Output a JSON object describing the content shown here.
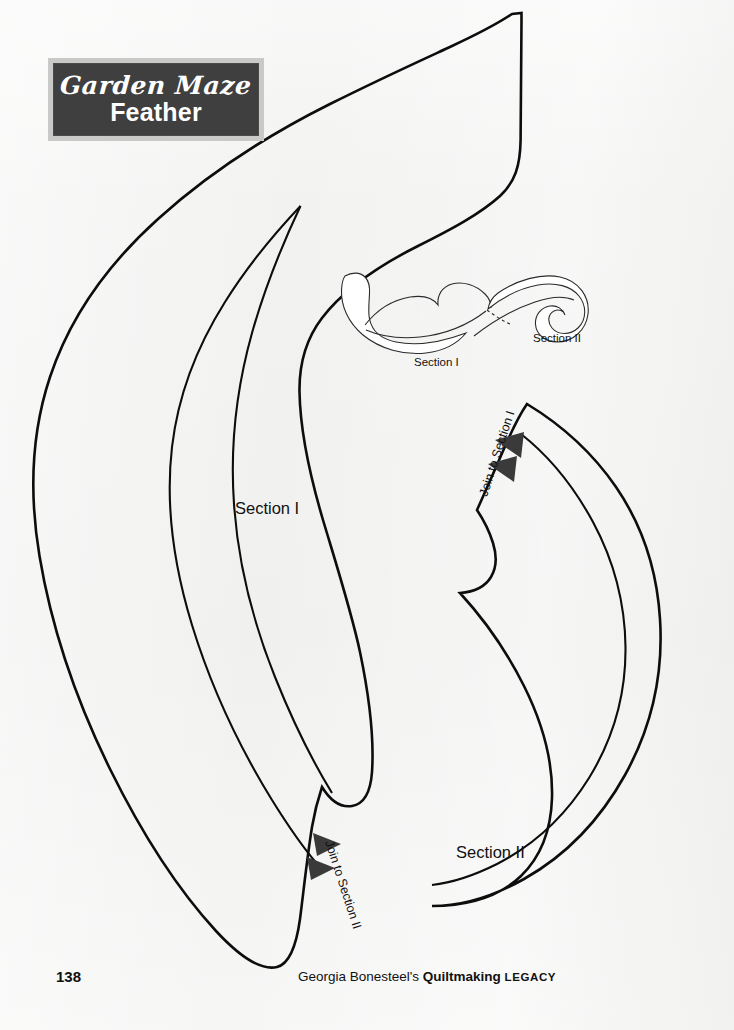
{
  "page": {
    "background_color": "#f2f2f1",
    "width": 734,
    "height": 1030
  },
  "title_block": {
    "script_line": "Garden Maze",
    "main_line": "Feather",
    "panel_color": "#3f3f3f",
    "frame_color": "#c9c9c8",
    "text_color": "#ffffff"
  },
  "pattern": {
    "outline_color": "#0d0d0d",
    "fill_color": "#ffffff",
    "marker_color": "#3a3a3a",
    "templates": [
      {
        "name": "section-one-template",
        "label": "Section I",
        "join_label": "Join to Section II",
        "marker_count": 2
      },
      {
        "name": "section-two-template",
        "label": "Section II",
        "join_label": "Join to Section I",
        "marker_count": 2
      }
    ]
  },
  "assembly_diagram": {
    "name": "assembly-diagram",
    "label_left": "Section I",
    "label_right": "Section II",
    "line_color": "#2b2b2b"
  },
  "footer": {
    "page_number": "138",
    "credit_prefix": "Georgia Bonesteel's ",
    "credit_bold": "Quiltmaking",
    "credit_smallcaps": "LEGACY"
  }
}
